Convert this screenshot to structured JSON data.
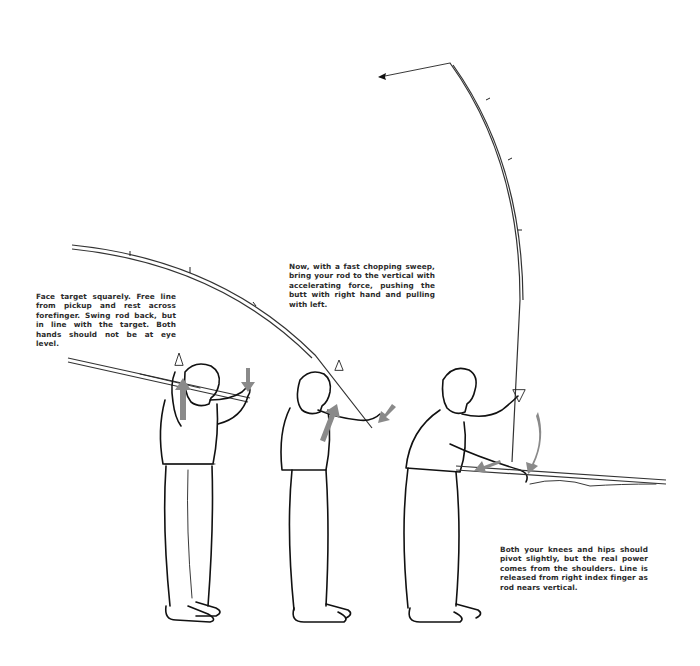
{
  "illustration": {
    "subject": "spinning rod overhead cast sequence",
    "figures": [
      {
        "step": 1,
        "pose": "rod back over shoulder"
      },
      {
        "step": 2,
        "pose": "chopping sweep"
      },
      {
        "step": 3,
        "pose": "rod vertical, line released"
      }
    ],
    "colors": {
      "ink": "#111111",
      "arrow": "#8a8a8a",
      "text": "#2b2b2b",
      "background": "#ffffff"
    }
  },
  "captions": {
    "step1": "Face target squarely. Free line from pickup and rest across forefinger. Swing rod back, but in line with the target. Both hands should not be at eye level.",
    "step2": "Now, with a fast chopping sweep, bring your rod to the vertical with accelerating force, pushing the butt with right hand and pulling with left.",
    "step3": "Both your knees and hips should pivot slightly, but the real power comes from the shoulders. Line is released from right index finger as rod nears vertical."
  }
}
